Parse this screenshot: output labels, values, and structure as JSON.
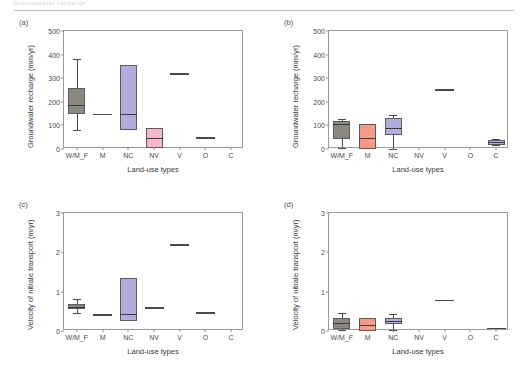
{
  "header": {
    "text": "Groundwater recharge",
    "visible": true
  },
  "figure": {
    "panels": [
      "a",
      "b",
      "c",
      "d"
    ]
  },
  "labels": {
    "panel_a": "(a)",
    "panel_b": "(b)",
    "panel_c": "(c)",
    "panel_d": "(d)",
    "xlabel": "Land-use types",
    "ylabel_recharge": "Groundwater recharge (mm/yr)",
    "ylabel_velocity": "Velocity of nitrate transport (m/yr)"
  },
  "colors": {
    "gray_fill": "#8a887f",
    "gray_fill_light": "#9a988f",
    "coral_fill": "#f79a86",
    "purple_fill": "#b0addc",
    "pink_fill": "#f3b8ce",
    "axis": "#9b9b9b",
    "text": "#3a3a3a"
  },
  "chart_data": [
    {
      "type": "box",
      "panel": "(a)",
      "title": "(a)",
      "xlabel": "Land-use types",
      "ylabel": "Groundwater recharge (mm/yr)",
      "ylim": [
        0,
        500
      ],
      "yticks": [
        0,
        100,
        200,
        300,
        400,
        500
      ],
      "grid": false,
      "categories": [
        "W/M_F",
        "M",
        "NC",
        "NV",
        "V",
        "O",
        "C"
      ],
      "boxes": [
        {
          "category": "W/M_F",
          "whisker_low": 80,
          "q1": 148,
          "median": 188,
          "q3": 258,
          "whisker_high": 383,
          "color": "#8a887f",
          "kind": "box"
        },
        {
          "category": "M",
          "value": 150,
          "color": "#4a4a4a",
          "kind": "line"
        },
        {
          "category": "NC",
          "whisker_low": 80,
          "q1": 80,
          "median": 148,
          "q3": 355,
          "whisker_high": 355,
          "color": "#b0addc",
          "kind": "box"
        },
        {
          "category": "NV",
          "whisker_low": 5,
          "q1": 5,
          "median": 48,
          "q3": 90,
          "whisker_high": 90,
          "color": "#f3b8ce",
          "kind": "box"
        },
        {
          "category": "V",
          "value": 320,
          "color": "#4a4a4a",
          "kind": "line"
        },
        {
          "category": "O",
          "value": 50,
          "color": "#4a4a4a",
          "kind": "line"
        },
        {
          "category": "C",
          "value": null,
          "color": "#4a4a4a",
          "kind": "none"
        }
      ]
    },
    {
      "type": "box",
      "panel": "(b)",
      "title": "(b)",
      "xlabel": "Land-use types",
      "ylabel": "Groundwater recharge (mm/yr)",
      "ylim": [
        0,
        500
      ],
      "yticks": [
        0,
        100,
        200,
        300,
        400,
        500
      ],
      "grid": false,
      "categories": [
        "W/M_F",
        "M",
        "NC",
        "NV",
        "V",
        "O",
        "C"
      ],
      "boxes": [
        {
          "category": "W/M_F",
          "whisker_low": 3,
          "q1": 42,
          "median": 105,
          "q3": 118,
          "whisker_high": 128,
          "color": "#8a887f",
          "kind": "box"
        },
        {
          "category": "M",
          "whisker_low": 0,
          "q1": 0,
          "median": 45,
          "q3": 105,
          "whisker_high": 105,
          "color": "#f79a86",
          "kind": "box"
        },
        {
          "category": "NC",
          "whisker_low": 2,
          "q1": 60,
          "median": 90,
          "q3": 132,
          "whisker_high": 145,
          "color": "#b0addc",
          "kind": "box"
        },
        {
          "category": "NV",
          "value": null,
          "color": "#4a4a4a",
          "kind": "none"
        },
        {
          "category": "V",
          "value": 253,
          "color": "#4a4a4a",
          "kind": "line"
        },
        {
          "category": "O",
          "value": null,
          "color": "#4a4a4a",
          "kind": "none"
        },
        {
          "category": "C",
          "whisker_low": 15,
          "q1": 18,
          "median": 28,
          "q3": 40,
          "whisker_high": 42,
          "color": "#b0addc",
          "kind": "box"
        }
      ]
    },
    {
      "type": "box",
      "panel": "(c)",
      "title": "(c)",
      "xlabel": "Land-use types",
      "ylabel": "Velocity of nitrate transport (m/yr)",
      "ylim": [
        0,
        3
      ],
      "yticks": [
        0,
        1,
        2,
        3
      ],
      "grid": false,
      "categories": [
        "W/M_F",
        "M",
        "NC",
        "NV",
        "V",
        "O",
        "C"
      ],
      "boxes": [
        {
          "category": "W/M_F",
          "whisker_low": 0.45,
          "q1": 0.55,
          "median": 0.62,
          "q3": 0.68,
          "whisker_high": 0.82,
          "color": "#8a887f",
          "kind": "box"
        },
        {
          "category": "M",
          "value": 0.42,
          "color": "#4a4a4a",
          "kind": "line"
        },
        {
          "category": "NC",
          "whisker_low": 0.26,
          "q1": 0.26,
          "median": 0.44,
          "q3": 1.34,
          "whisker_high": 1.34,
          "color": "#b0addc",
          "kind": "box"
        },
        {
          "category": "NV",
          "value": 0.6,
          "color": "#4a4a4a",
          "kind": "line"
        },
        {
          "category": "V",
          "value": 2.2,
          "color": "#4a4a4a",
          "kind": "line"
        },
        {
          "category": "O",
          "value": 0.48,
          "color": "#4a4a4a",
          "kind": "line"
        },
        {
          "category": "C",
          "value": null,
          "color": "#4a4a4a",
          "kind": "none"
        }
      ]
    },
    {
      "type": "box",
      "panel": "(d)",
      "title": "(d)",
      "xlabel": "Land-use types",
      "ylabel": "Velocity of nitrate transport (m/yr)",
      "ylim": [
        0,
        3
      ],
      "yticks": [
        0,
        1,
        2,
        3
      ],
      "grid": false,
      "categories": [
        "W/M_F",
        "M",
        "NC",
        "NV",
        "V",
        "O",
        "C"
      ],
      "boxes": [
        {
          "category": "W/M_F",
          "whisker_low": 0.02,
          "q1": 0.05,
          "median": 0.2,
          "q3": 0.33,
          "whisker_high": 0.46,
          "color": "#8a887f",
          "kind": "box"
        },
        {
          "category": "M",
          "whisker_low": 0.0,
          "q1": 0.0,
          "median": 0.16,
          "q3": 0.32,
          "whisker_high": 0.32,
          "color": "#f79a86",
          "kind": "box"
        },
        {
          "category": "NC",
          "whisker_low": 0.02,
          "q1": 0.17,
          "median": 0.25,
          "q3": 0.33,
          "whisker_high": 0.42,
          "color": "#b0addc",
          "kind": "box"
        },
        {
          "category": "NV",
          "value": null,
          "color": "#4a4a4a",
          "kind": "none"
        },
        {
          "category": "V",
          "value": 0.79,
          "color": "#4a4a4a",
          "kind": "line"
        },
        {
          "category": "O",
          "value": null,
          "color": "#4a4a4a",
          "kind": "none"
        },
        {
          "category": "C",
          "value": 0.08,
          "color": "#4a4a4a",
          "kind": "line"
        }
      ]
    }
  ]
}
